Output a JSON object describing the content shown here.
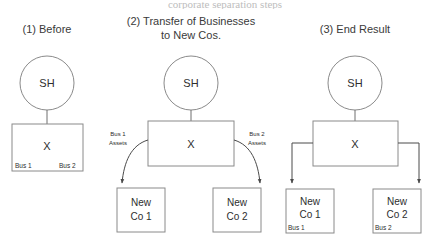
{
  "figure": {
    "clipped_header_text": "corporate separation steps",
    "panels": [
      {
        "id": "panel-before",
        "title": "(1) Before",
        "shareholder_label": "SH",
        "entity_label": "X",
        "entity_corner_left": "Bus 1",
        "entity_corner_right": "Bus 2",
        "new_companies": [],
        "edge_labels": []
      },
      {
        "id": "panel-transfer",
        "title_line1": "(2) Transfer of Businesses",
        "title_line2": "to New Cos.",
        "shareholder_label": "SH",
        "entity_label": "X",
        "edge_label_left_line1": "Bus 1",
        "edge_label_left_line2": "Assets",
        "edge_label_right_line1": "Bus 2",
        "edge_label_right_line2": "Assets",
        "new_companies": [
          {
            "line1": "New",
            "line2": "Co 1",
            "corner": ""
          },
          {
            "line1": "New",
            "line2": "Co 2",
            "corner": ""
          }
        ]
      },
      {
        "id": "panel-end-result",
        "title": "(3) End Result",
        "shareholder_label": "SH",
        "entity_label": "X",
        "new_companies": [
          {
            "line1": "New",
            "line2": "Co 1",
            "corner": "Bus 1"
          },
          {
            "line1": "New",
            "line2": "Co 2",
            "corner": "Bus 2"
          }
        ]
      }
    ],
    "colors": {
      "background": "#ffffff",
      "stroke": "#8a8a8a",
      "connector": "#6e6e6e",
      "arrow": "#4a4a4a",
      "title_text": "#3a3a3a",
      "body_text": "#2e2e2e"
    }
  }
}
